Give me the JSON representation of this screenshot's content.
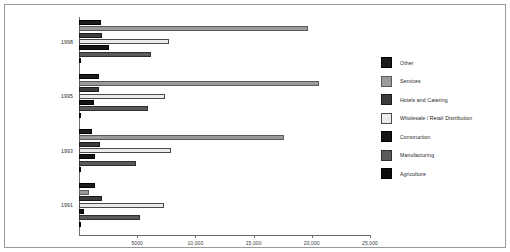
{
  "chart_data": {
    "type": "bar",
    "orientation": "horizontal",
    "title": "",
    "xlabel": "",
    "ylabel": "",
    "categories": [
      "1998",
      "1995",
      "1993",
      "1991"
    ],
    "xlim": [
      0,
      25000
    ],
    "xticks": [
      5000,
      10000,
      15000,
      20000,
      25000
    ],
    "xticklabels": [
      "5000",
      "10,000",
      "15,000",
      "20,000",
      "25,000"
    ],
    "grid": false,
    "legend_position": "right",
    "series": [
      {
        "name": "Other",
        "color": "#1c1c1c",
        "border": "#000000",
        "values": [
          1900,
          1750,
          1100,
          1400
        ]
      },
      {
        "name": "Services",
        "color": "#9a9a9a",
        "border": "#5a5a5a",
        "values": [
          19700,
          20600,
          17600,
          900
        ]
      },
      {
        "name": "Hotels and Catering",
        "color": "#3c3c3c",
        "border": "#1a1a1a",
        "values": [
          1950,
          1700,
          1800,
          1950
        ]
      },
      {
        "name": "Wholesale / Retail Distribution",
        "color": "#ebebeb",
        "border": "#4a4a4a",
        "values": [
          7700,
          7400,
          7900,
          7300
        ]
      },
      {
        "name": "Construction",
        "color": "#141414",
        "border": "#000000",
        "values": [
          2600,
          1300,
          1400,
          400
        ]
      },
      {
        "name": "Manufacturing",
        "color": "#5a5a5a",
        "border": "#2e2e2e",
        "values": [
          6200,
          5900,
          4900,
          5200
        ]
      },
      {
        "name": "Agriculture",
        "color": "#0d0d0d",
        "border": "#000000",
        "values": [
          200,
          180,
          180,
          170
        ]
      }
    ]
  },
  "legend": {
    "items": [
      {
        "label": "Other"
      },
      {
        "label": "Services"
      },
      {
        "label": "Hotels and Catering"
      },
      {
        "label": "Wholesale / Retail Distribution"
      },
      {
        "label": "Construction"
      },
      {
        "label": "Manufacturing"
      },
      {
        "label": "Agriculture"
      }
    ]
  },
  "colors": {
    "frame_border": "#9a9a9a",
    "axis": "#6e6e6e",
    "background": "#ffffff",
    "text": "#242424"
  }
}
